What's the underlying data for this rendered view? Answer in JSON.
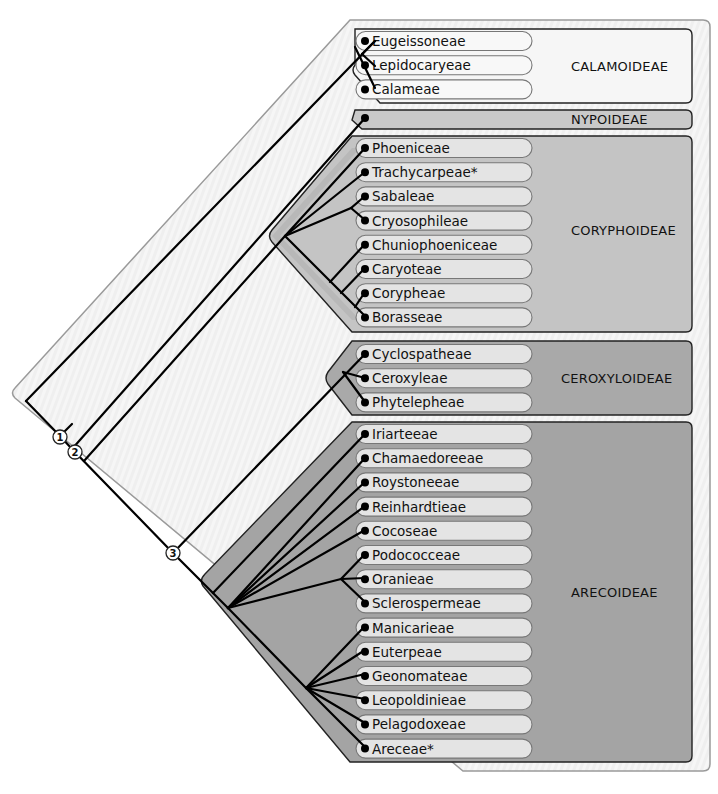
{
  "diagram": {
    "type": "phylogenetic-tree",
    "nodes": [
      {
        "id": "1",
        "label": "1"
      },
      {
        "id": "2",
        "label": "2"
      },
      {
        "id": "3",
        "label": "3"
      }
    ],
    "subfamilies": [
      {
        "name": "CALAMOIDEAE",
        "fill": "#f4f4f4",
        "tribes": [
          "Eugeissoneae",
          "Lepidocaryeae",
          "Calameae"
        ]
      },
      {
        "name": "NYPOIDEAE",
        "fill": "#c9c9c9",
        "tribes": []
      },
      {
        "name": "CORYPHOIDEAE",
        "fill": "#c4c4c4",
        "tribes": [
          "Phoeniceae",
          "Trachycarpeae*",
          "Sabaleae",
          "Cryosophileae",
          "Chuniophoeniceae",
          "Caryoteae",
          "Corypheae",
          "Borasseae"
        ]
      },
      {
        "name": "CEROXYLOIDEAE",
        "fill": "#a9a9a9",
        "tribes": [
          "Cyclospatheae",
          "Ceroxyleae",
          "Phytelepheae"
        ]
      },
      {
        "name": "ARECOIDEAE",
        "fill": "#a4a4a4",
        "tribes": [
          "Iriarteeae",
          "Chamaedoreeae",
          "Roystoneeae",
          "Reinhardtieae",
          "Cocoseae",
          "Podococceae",
          "Oranieae",
          "Sclerospermeae",
          "Manicarieae",
          "Euterpeae",
          "Geonomateae",
          "Leopoldinieae",
          "Pelagodoxeae",
          "Areceae*"
        ]
      }
    ]
  }
}
